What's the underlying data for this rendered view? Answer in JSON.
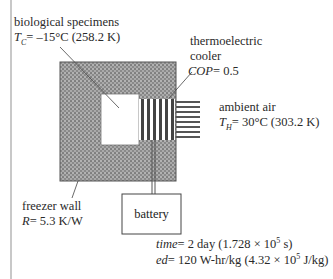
{
  "specimens": {
    "title": "biological specimens",
    "symbol": "T",
    "subscript": "C",
    "equals": "= –15°C (258.2 K)"
  },
  "cooler": {
    "line1": "thermoelectric",
    "line2": "cooler",
    "symbol": "COP",
    "value": "= 0.5"
  },
  "ambient": {
    "title": "ambient air",
    "symbol": "T",
    "subscript": "H",
    "equals": "= 30°C (303.2 K)"
  },
  "wall": {
    "title": "freezer wall",
    "symbol": "R",
    "value": "= 5.3 K/W"
  },
  "battery": {
    "label": "battery"
  },
  "specs": {
    "time_symbol": "time",
    "time_value": "= 2 day (1.728 × 10",
    "time_exp": "5",
    "time_unit": " s)",
    "ed_symbol": "ed",
    "ed_value": "= 120 W-hr/kg (4.32 × 10",
    "ed_exp": "5",
    "ed_unit": " J/kg)"
  },
  "colors": {
    "wall_fill": "#7a7a7a",
    "stripe_dark": "#444444",
    "frame": "#c8c8c8"
  }
}
